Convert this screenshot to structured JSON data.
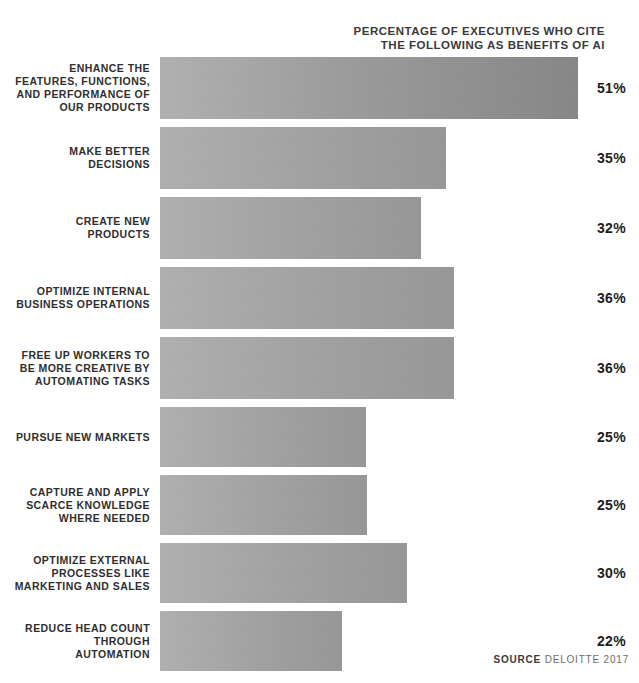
{
  "title": {
    "line1": "PERCENTAGE OF EXECUTIVES WHO CITE",
    "line2": "THE FOLLOWING AS BENEFITS OF AI"
  },
  "source": {
    "label": "SOURCE",
    "text": "DELOITTE 2017"
  },
  "colors": {
    "bar_light": "#b1b1b1",
    "bar_mid": "#a2a2a2",
    "bar_dark": "#878787",
    "value_text": "#1d1d1d",
    "label_text": "#2f2f2f",
    "background": "#ffffff"
  },
  "chart_data": {
    "type": "bar",
    "orientation": "horizontal",
    "title": "PERCENTAGE OF EXECUTIVES WHO CITE THE FOLLOWING AS BENEFITS OF AI",
    "xlabel": "",
    "ylabel": "",
    "grid": false,
    "legend": false,
    "unit": "%",
    "source": "SOURCE DELOITTE 2017",
    "categories": [
      "ENHANCE THE FEATURES, FUNCTIONS, AND PERFORMANCE OF OUR PRODUCTS",
      "MAKE BETTER DECISIONS",
      "CREATE NEW PRODUCTS",
      "OPTIMIZE INTERNAL BUSINESS OPERATIONS",
      "FREE UP WORKERS TO BE MORE CREATIVE BY AUTOMATING TASKS",
      "PURSUE NEW MARKETS",
      "CAPTURE AND APPLY SCARCE KNOWLEDGE WHERE NEEDED",
      "OPTIMIZE EXTERNAL PROCESSES LIKE MARKETING AND SALES",
      "REDUCE HEAD COUNT THROUGH AUTOMATION"
    ],
    "values": [
      51,
      35,
      32,
      36,
      36,
      25,
      25,
      30,
      22
    ],
    "value_labels": [
      "51%",
      "35%",
      "32%",
      "36%",
      "36%",
      "25%",
      "25%",
      "30%",
      "22%"
    ]
  },
  "bars": [
    {
      "label_lines": [
        "ENHANCE THE",
        "FEATURES, FUNCTIONS,",
        "AND PERFORMANCE OF",
        "OUR PRODUCTS"
      ],
      "value": 51,
      "value_label": "51%",
      "bar_px": 418,
      "height_px": 62,
      "shade": "dark"
    },
    {
      "label_lines": [
        "MAKE BETTER",
        "DECISIONS"
      ],
      "value": 35,
      "value_label": "35%",
      "bar_px": 286,
      "height_px": 62,
      "shade": "light"
    },
    {
      "label_lines": [
        "CREATE NEW",
        "PRODUCTS"
      ],
      "value": 32,
      "value_label": "32%",
      "bar_px": 261,
      "height_px": 62,
      "shade": "light"
    },
    {
      "label_lines": [
        "OPTIMIZE INTERNAL",
        "BUSINESS OPERATIONS"
      ],
      "value": 36,
      "value_label": "36%",
      "bar_px": 294,
      "height_px": 62,
      "shade": "light"
    },
    {
      "label_lines": [
        "FREE UP WORKERS TO",
        "BE MORE CREATIVE BY",
        "AUTOMATING TASKS"
      ],
      "value": 36,
      "value_label": "36%",
      "bar_px": 294,
      "height_px": 62,
      "shade": "light"
    },
    {
      "label_lines": [
        "PURSUE NEW MARKETS"
      ],
      "value": 25,
      "value_label": "25%",
      "bar_px": 206,
      "height_px": 60,
      "shade": "light"
    },
    {
      "label_lines": [
        "CAPTURE AND APPLY",
        "SCARCE KNOWLEDGE",
        "WHERE NEEDED"
      ],
      "value": 25,
      "value_label": "25%",
      "bar_px": 207,
      "height_px": 60,
      "shade": "light"
    },
    {
      "label_lines": [
        "OPTIMIZE EXTERNAL",
        "PROCESSES LIKE",
        "MARKETING AND SALES"
      ],
      "value": 30,
      "value_label": "30%",
      "bar_px": 247,
      "height_px": 60,
      "shade": "light"
    },
    {
      "label_lines": [
        "REDUCE HEAD COUNT",
        "THROUGH",
        "AUTOMATION"
      ],
      "value": 22,
      "value_label": "22%",
      "bar_px": 182,
      "height_px": 60,
      "shade": "light"
    }
  ]
}
